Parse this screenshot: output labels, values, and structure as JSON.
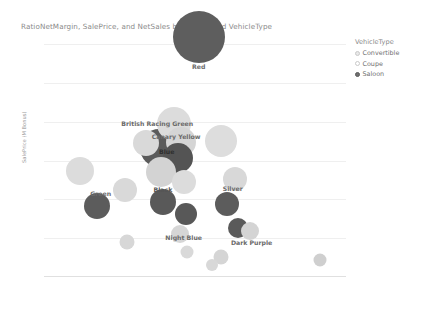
{
  "title": "RatioNetMargin, SalePrice, and NetSales by Colour, and VehicleType",
  "legend": {
    "title": "VehicleType",
    "items": [
      {
        "label": "Convertible",
        "swatch": "legend-swatch-convertible",
        "color": "#e8e8e8",
        "border": "#c9c9c9"
      },
      {
        "label": "Coupe",
        "swatch": "legend-swatch-coupe",
        "color": "#ffffff",
        "border": "#c9c9c9"
      },
      {
        "label": "Saloon",
        "swatch": "legend-swatch-saloon",
        "color": "#6f6f6f",
        "border": "#5a5a5a"
      }
    ]
  },
  "axes": {
    "x": {
      "label": "RatioNetMargin",
      "ticks": [
        "0.00 %",
        "10.00 %",
        "20.00 %",
        "30.00 %",
        "40.00 %",
        "50.00 %",
        "60.00 %",
        "70.00 %",
        "80.00 %"
      ],
      "values": [
        0,
        10,
        20,
        30,
        40,
        50,
        60,
        70,
        80
      ],
      "min": 0,
      "max": 80
    },
    "y": {
      "label": "SalePrice (M Bonus)",
      "ticks": [
        "1.2M",
        "1M",
        "0.8M",
        "0.6M",
        "0.4M",
        "0.2M",
        "0M"
      ],
      "values": [
        1200000,
        1000000,
        800000,
        600000,
        400000,
        200000,
        0
      ],
      "min": 0,
      "max": 1200000
    }
  },
  "chart_data": {
    "type": "scatter",
    "title": "RatioNetMargin, SalePrice, and NetSales by Colour, and VehicleType",
    "xlabel": "RatioNetMargin",
    "ylabel": "SalePrice (M Bonus)",
    "xlim": [
      0,
      80
    ],
    "ylim": [
      0,
      1200000
    ],
    "grid": true,
    "legend_position": "right",
    "size_field": "NetSales",
    "color_field": "Colour",
    "shape_field": "VehicleType",
    "points": [
      {
        "colour": "Red",
        "vehicle_type": "Saloon",
        "x": 41.0,
        "y": 1235000,
        "size": 52,
        "fill": "#5e5e5e",
        "label": "Red",
        "label_x": 41.0,
        "label_y": 1085000,
        "label_color": "#6a6a6a"
      },
      {
        "colour": "British Racing Green",
        "vehicle_type": "Convertible",
        "x": 34.5,
        "y": 790000,
        "size": 34,
        "fill": "#dcdcdc",
        "label": "British Racing Green",
        "label_x": 30.0,
        "label_y": 795000,
        "label_color": "#6a6a6a"
      },
      {
        "colour": "Canary Yellow",
        "vehicle_type": "Convertible",
        "x": 36.2,
        "y": 697000,
        "size": 30,
        "fill": "#d5d5d5",
        "label": "Canary Yellow",
        "label_x": 35.0,
        "label_y": 725000,
        "label_color": "#6a6a6a"
      },
      {
        "colour": "Blue",
        "vehicle_type": "Saloon",
        "x": 30.5,
        "y": 665000,
        "size": 38,
        "fill": "#5b5b5b",
        "label": "Blue",
        "label_x": 32.5,
        "label_y": 648000,
        "label_color": "#2f2f2f"
      },
      {
        "colour": "BlueDark",
        "vehicle_type": "Saloon",
        "x": 35.4,
        "y": 612000,
        "size": 30,
        "fill": "#545454",
        "label": "",
        "label_x": 0,
        "label_y": 0,
        "label_color": "#6a6a6a"
      },
      {
        "colour": "Pearl",
        "vehicle_type": "Convertible",
        "x": 47.0,
        "y": 700000,
        "size": 32,
        "fill": "#dddddd",
        "label": "",
        "label_x": 0,
        "label_y": 0,
        "label_color": "#6a6a6a"
      },
      {
        "colour": "Ivory",
        "vehicle_type": "Convertible",
        "x": 27.0,
        "y": 690000,
        "size": 26,
        "fill": "#d9d9d9",
        "label": "",
        "label_x": 0,
        "label_y": 0,
        "label_color": "#6a6a6a"
      },
      {
        "colour": "Grey",
        "vehicle_type": "Convertible",
        "x": 9.5,
        "y": 545000,
        "size": 28,
        "fill": "#dcdcdc",
        "label": "",
        "label_x": 0,
        "label_y": 0,
        "label_color": "#6a6a6a"
      },
      {
        "colour": "Black",
        "vehicle_type": "Convertible",
        "x": 31.0,
        "y": 540000,
        "size": 30,
        "fill": "#d3d3d3",
        "label": "Black",
        "label_x": 31.5,
        "label_y": 455000,
        "label_color": "#555555"
      },
      {
        "colour": "Stone",
        "vehicle_type": "Convertible",
        "x": 37.0,
        "y": 490000,
        "size": 24,
        "fill": "#dcdcdc",
        "label": "",
        "label_x": 0,
        "label_y": 0,
        "label_color": "#6a6a6a"
      },
      {
        "colour": "Silver",
        "vehicle_type": "Convertible",
        "x": 50.5,
        "y": 505000,
        "size": 24,
        "fill": "#d8d8d8",
        "label": "Silver",
        "label_x": 50.0,
        "label_y": 460000,
        "label_color": "#6a6a6a"
      },
      {
        "colour": "Sand",
        "vehicle_type": "Convertible",
        "x": 21.5,
        "y": 450000,
        "size": 24,
        "fill": "#d9d9d9",
        "label": "",
        "label_x": 0,
        "label_y": 0,
        "label_color": "#6a6a6a"
      },
      {
        "colour": "Green",
        "vehicle_type": "Saloon",
        "x": 14.0,
        "y": 368000,
        "size": 26,
        "fill": "#5c5c5c",
        "label": "Green",
        "label_x": 15.0,
        "label_y": 435000,
        "label_color": "#6a6a6a"
      },
      {
        "colour": "Charcoal",
        "vehicle_type": "Saloon",
        "x": 31.5,
        "y": 385000,
        "size": 26,
        "fill": "#595959",
        "label": "",
        "label_x": 0,
        "label_y": 0,
        "label_color": "#6a6a6a"
      },
      {
        "colour": "Graphite",
        "vehicle_type": "Saloon",
        "x": 37.5,
        "y": 322000,
        "size": 22,
        "fill": "#585858",
        "label": "",
        "label_x": 0,
        "label_y": 0,
        "label_color": "#6a6a6a"
      },
      {
        "colour": "Slate",
        "vehicle_type": "Saloon",
        "x": 48.5,
        "y": 378000,
        "size": 24,
        "fill": "#5c5c5c",
        "label": "",
        "label_x": 0,
        "label_y": 0,
        "label_color": "#6a6a6a"
      },
      {
        "colour": "Night Blue",
        "vehicle_type": "Convertible",
        "x": 36.0,
        "y": 222000,
        "size": 18,
        "fill": "#d6d6d6",
        "label": "Night Blue",
        "label_x": 37.0,
        "label_y": 205000,
        "label_color": "#6a6a6a"
      },
      {
        "colour": "Dark Purple",
        "vehicle_type": "Saloon",
        "x": 51.5,
        "y": 250000,
        "size": 20,
        "fill": "#5a5a5a",
        "label": "Dark Purple",
        "label_x": 55.0,
        "label_y": 182000,
        "label_color": "#6a6a6a"
      },
      {
        "colour": "Plum",
        "vehicle_type": "Convertible",
        "x": 54.5,
        "y": 235000,
        "size": 18,
        "fill": "#d4d4d4",
        "label": "",
        "label_x": 0,
        "label_y": 0,
        "label_color": "#6a6a6a"
      },
      {
        "colour": "Taupe",
        "vehicle_type": "Convertible",
        "x": 22.0,
        "y": 180000,
        "size": 15,
        "fill": "#d7d7d7",
        "label": "",
        "label_x": 0,
        "label_y": 0,
        "label_color": "#6a6a6a"
      },
      {
        "colour": "Ash",
        "vehicle_type": "Convertible",
        "x": 38.0,
        "y": 130000,
        "size": 13,
        "fill": "#d9d9d9",
        "label": "",
        "label_x": 0,
        "label_y": 0,
        "label_color": "#6a6a6a"
      },
      {
        "colour": "Mist",
        "vehicle_type": "Convertible",
        "x": 47.0,
        "y": 105000,
        "size": 15,
        "fill": "#d5d5d5",
        "label": "",
        "label_x": 0,
        "label_y": 0,
        "label_color": "#6a6a6a"
      },
      {
        "colour": "Bronze",
        "vehicle_type": "Convertible",
        "x": 44.5,
        "y": 60000,
        "size": 12,
        "fill": "#d8d8d8",
        "label": "",
        "label_x": 0,
        "label_y": 0,
        "label_color": "#6a6a6a"
      },
      {
        "colour": "Copper",
        "vehicle_type": "Convertible",
        "x": 73.0,
        "y": 85000,
        "size": 13,
        "fill": "#cfcfcf",
        "label": "",
        "label_x": 0,
        "label_y": 0,
        "label_color": "#6a6a6a"
      }
    ]
  }
}
